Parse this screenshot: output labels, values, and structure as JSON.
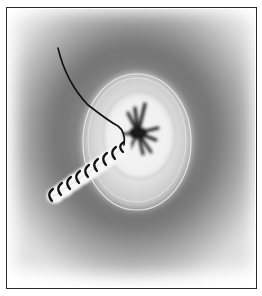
{
  "illustration": {
    "subject": "purse-string suture / stoma closure illustration",
    "colors": {
      "frame": "#2a2a2a",
      "background": "#ffffff",
      "tissue_light": "#d8d8d8",
      "tissue_dark": "#6e6e6e",
      "ellipse_highlight": "#f2f2f2",
      "suture": "#111111"
    },
    "elements": {
      "frame": "border",
      "tissue_field": "gradient background",
      "central_orifice": "dark star-shaped opening",
      "raised_ring": "elliptical mound",
      "suture_thread": "free thread end",
      "stitched_incision": "running suture line",
      "stitch_count": 8
    }
  }
}
